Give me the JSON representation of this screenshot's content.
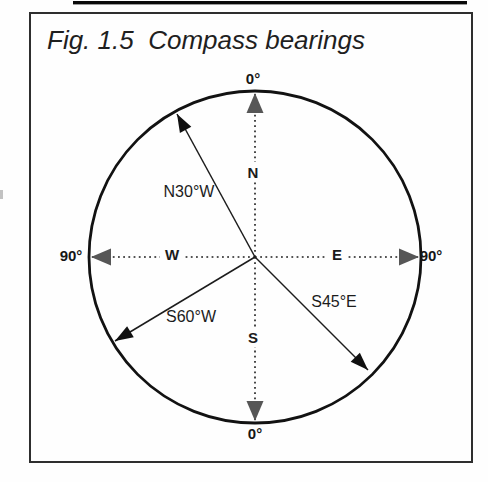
{
  "figure": {
    "title": "Fig. 1.5  Compass bearings",
    "cardinals": {
      "north": "N",
      "south": "S",
      "east": "E",
      "west": "W"
    },
    "degree_labels": {
      "top": "0°",
      "bottom": "0°",
      "left": "90°",
      "right": "90°"
    },
    "bearings": [
      {
        "label": "N30°W"
      },
      {
        "label": "S60°W"
      },
      {
        "label": "S45°E"
      }
    ],
    "colors": {
      "ink": "#1c1c1c",
      "circle": "#121212",
      "axis_arrow": "#565656",
      "bearing_arrow": "#101010",
      "frame": "#2e2e2e",
      "artifact": "#0a0a0a"
    }
  }
}
